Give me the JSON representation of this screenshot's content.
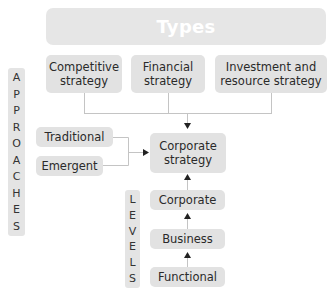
{
  "header": {
    "title": "Types"
  },
  "types": [
    {
      "label": "Competitive strategy",
      "line1": "Competitive",
      "line2": "strategy"
    },
    {
      "label": "Financial strategy",
      "line1": "Financial",
      "line2": "strategy"
    },
    {
      "label": "Investment and resource strategy",
      "line1": "Investment and",
      "line2": "resource strategy"
    }
  ],
  "approaches": {
    "title": "APPROACHES",
    "letters": [
      "A",
      "P",
      "P",
      "R",
      "O",
      "A",
      "C",
      "H",
      "E",
      "S"
    ],
    "items": [
      {
        "label": "Traditional"
      },
      {
        "label": "Emergent"
      }
    ]
  },
  "center": {
    "line1": "Corporate",
    "line2": "strategy"
  },
  "levels": {
    "title": "LEVELS",
    "letters": [
      "L",
      "E",
      "V",
      "E",
      "L",
      "S"
    ],
    "items": [
      {
        "label": "Corporate"
      },
      {
        "label": "Business"
      },
      {
        "label": "Functional"
      }
    ]
  },
  "colors": {
    "box_fill": "#e2e2e2",
    "line": "#c8c8c8",
    "arrow": "#222222",
    "text": "#2a2a2a",
    "header_text": "#ffffff"
  }
}
